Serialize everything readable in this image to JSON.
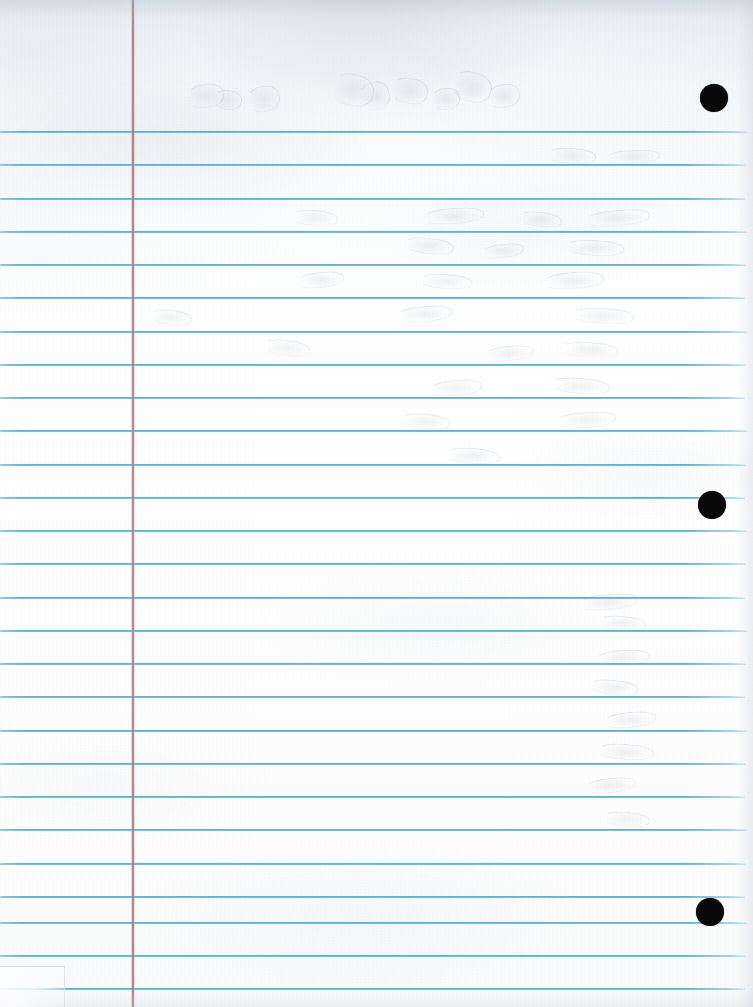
{
  "document": {
    "type": "lined-notebook-paper",
    "title": "Blank ruled notebook page",
    "content_text": "",
    "orientation": "portrait",
    "width_px": 753,
    "height_px": 1007
  },
  "colors": {
    "paper": "#fdfdfe",
    "rule_blue": "#4fb1df",
    "margin_rose": "#b08688",
    "hole_black": "#090909",
    "edge_shadow": "#b0bcc8"
  },
  "ruling": {
    "style": "college-ruled",
    "line_count": 27,
    "first_line_y": 131,
    "spacing_px": 33.3,
    "line_thickness_px": 2,
    "lines_y": [
      131,
      164,
      198,
      231,
      264,
      297,
      331,
      364,
      397,
      430,
      464,
      497,
      530,
      563,
      597,
      630,
      663,
      696,
      730,
      763,
      796,
      829,
      863,
      896,
      922,
      955,
      988
    ]
  },
  "margin_rule": {
    "orientation": "vertical",
    "x": 132,
    "thickness_px": 2,
    "label": "margin-line"
  },
  "holes": [
    {
      "label": "top-hole",
      "cx": 714,
      "cy": 98,
      "r": 14
    },
    {
      "label": "middle-hole",
      "cx": 712,
      "cy": 505,
      "r": 14
    },
    {
      "label": "bottom-hole",
      "cx": 710,
      "cy": 912,
      "r": 14
    }
  ],
  "header_area": {
    "label": "unruled-header",
    "top_y": 0,
    "bottom_y": 131,
    "written_text": ""
  },
  "ghost_impressions": {
    "description": "faint indentation marks from writing on a previous sheet",
    "visible_text": "",
    "marks": [
      {
        "x": 188,
        "y": 84,
        "w": 34,
        "h": 22,
        "rot": -8
      },
      {
        "x": 214,
        "y": 90,
        "w": 26,
        "h": 18,
        "rot": 6
      },
      {
        "x": 248,
        "y": 86,
        "w": 30,
        "h": 24,
        "rot": -12
      },
      {
        "x": 332,
        "y": 74,
        "w": 40,
        "h": 30,
        "rot": 14
      },
      {
        "x": 360,
        "y": 82,
        "w": 28,
        "h": 26,
        "rot": -18
      },
      {
        "x": 392,
        "y": 78,
        "w": 34,
        "h": 24,
        "rot": 10
      },
      {
        "x": 432,
        "y": 88,
        "w": 26,
        "h": 20,
        "rot": -6
      },
      {
        "x": 452,
        "y": 72,
        "w": 38,
        "h": 28,
        "rot": 16
      },
      {
        "x": 488,
        "y": 84,
        "w": 30,
        "h": 22,
        "rot": -10
      },
      {
        "x": 548,
        "y": 148,
        "w": 46,
        "h": 14,
        "rot": 4
      },
      {
        "x": 606,
        "y": 150,
        "w": 52,
        "h": 12,
        "rot": -3
      },
      {
        "x": 292,
        "y": 210,
        "w": 44,
        "h": 14,
        "rot": 5
      },
      {
        "x": 424,
        "y": 208,
        "w": 58,
        "h": 14,
        "rot": -4
      },
      {
        "x": 520,
        "y": 212,
        "w": 40,
        "h": 13,
        "rot": 7
      },
      {
        "x": 586,
        "y": 210,
        "w": 62,
        "h": 14,
        "rot": -5
      },
      {
        "x": 404,
        "y": 238,
        "w": 48,
        "h": 14,
        "rot": 6
      },
      {
        "x": 482,
        "y": 244,
        "w": 40,
        "h": 12,
        "rot": -7
      },
      {
        "x": 566,
        "y": 240,
        "w": 56,
        "h": 14,
        "rot": 3
      },
      {
        "x": 298,
        "y": 272,
        "w": 44,
        "h": 14,
        "rot": -6
      },
      {
        "x": 420,
        "y": 274,
        "w": 50,
        "h": 13,
        "rot": 4
      },
      {
        "x": 544,
        "y": 272,
        "w": 58,
        "h": 15,
        "rot": -4
      },
      {
        "x": 150,
        "y": 310,
        "w": 40,
        "h": 13,
        "rot": 6
      },
      {
        "x": 398,
        "y": 306,
        "w": 52,
        "h": 14,
        "rot": -5
      },
      {
        "x": 572,
        "y": 308,
        "w": 60,
        "h": 14,
        "rot": 3
      },
      {
        "x": 264,
        "y": 340,
        "w": 44,
        "h": 14,
        "rot": 7
      },
      {
        "x": 484,
        "y": 346,
        "w": 48,
        "h": 13,
        "rot": -6
      },
      {
        "x": 562,
        "y": 342,
        "w": 54,
        "h": 14,
        "rot": 4
      },
      {
        "x": 430,
        "y": 380,
        "w": 50,
        "h": 14,
        "rot": -5
      },
      {
        "x": 552,
        "y": 378,
        "w": 56,
        "h": 14,
        "rot": 5
      },
      {
        "x": 402,
        "y": 414,
        "w": 46,
        "h": 13,
        "rot": 6
      },
      {
        "x": 556,
        "y": 412,
        "w": 58,
        "h": 14,
        "rot": -4
      },
      {
        "x": 446,
        "y": 448,
        "w": 52,
        "h": 14,
        "rot": 4
      },
      {
        "x": 580,
        "y": 594,
        "w": 56,
        "h": 14,
        "rot": -5
      },
      {
        "x": 600,
        "y": 616,
        "w": 44,
        "h": 13,
        "rot": 5
      },
      {
        "x": 596,
        "y": 650,
        "w": 52,
        "h": 14,
        "rot": -4
      },
      {
        "x": 590,
        "y": 680,
        "w": 46,
        "h": 13,
        "rot": 6
      },
      {
        "x": 604,
        "y": 712,
        "w": 50,
        "h": 14,
        "rot": -5
      },
      {
        "x": 598,
        "y": 744,
        "w": 54,
        "h": 14,
        "rot": 4
      },
      {
        "x": 586,
        "y": 778,
        "w": 48,
        "h": 13,
        "rot": -6
      },
      {
        "x": 604,
        "y": 812,
        "w": 44,
        "h": 13,
        "rot": 5
      }
    ]
  }
}
